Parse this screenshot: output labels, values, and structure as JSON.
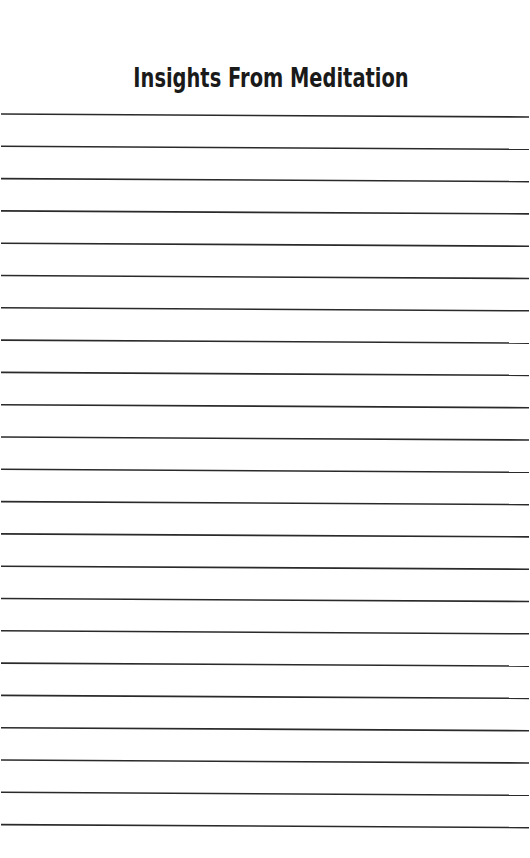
{
  "page": {
    "title": "Insights From Meditation",
    "background_color": "#ffffff",
    "line_color": "#2a2a2a",
    "ruled_lines": {
      "count": 23,
      "first_y_left": 114,
      "first_y_right": 117,
      "spacing": 32.3
    }
  }
}
